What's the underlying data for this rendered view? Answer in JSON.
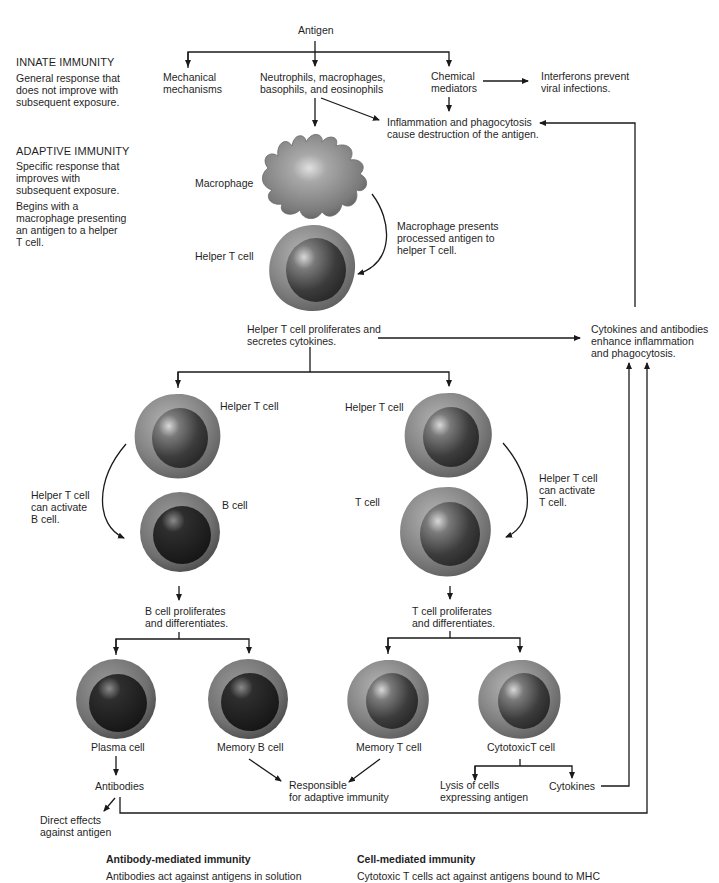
{
  "sidebar": {
    "innate": {
      "title": "INNATE IMMUNITY",
      "lines": [
        "General response that",
        "does not improve with",
        "subsequent exposure."
      ]
    },
    "adaptive": {
      "title": "ADAPTIVE IMMUNITY",
      "lines": [
        "Specific response that",
        "improves with",
        "subsequent exposure."
      ],
      "lines2": [
        "Begins with a",
        "macrophage presenting",
        "an antigen to a helper",
        "T cell."
      ]
    }
  },
  "nodes": {
    "antigen": "Antigen",
    "mechanical": [
      "Mechanical",
      "mechanisms"
    ],
    "neutrophils": [
      "Neutrophils, macrophages,",
      "basophils, and eosinophils"
    ],
    "chemical": [
      "Chemical",
      "mediators"
    ],
    "interferons": [
      "Interferons prevent",
      "viral infections."
    ],
    "inflammation": [
      "Inflammation and phagocytosis",
      "cause destruction of the antigen."
    ],
    "macrophage": "Macrophage",
    "macrophage_presents": [
      "Macrophage presents",
      "processed antigen to",
      "helper T cell."
    ],
    "helper_t_top": "Helper T cell",
    "helper_proliferates": [
      "Helper T cell proliferates and",
      "secretes cytokines."
    ],
    "cytokines_antibodies": [
      "Cytokines and antibodies",
      "enhance inflammation",
      "and phagocytosis."
    ],
    "helper_t_left": "Helper T cell",
    "helper_t_right": "Helper T cell",
    "activate_b": [
      "Helper T cell",
      "can activate",
      "B cell."
    ],
    "b_cell": "B cell",
    "t_cell": "T cell",
    "activate_t": [
      "Helper T cell",
      "can activate",
      "T cell."
    ],
    "b_proliferates": [
      "B cell proliferates",
      "and differentiates."
    ],
    "t_proliferates": [
      "T cell proliferates",
      "and differentiates."
    ],
    "plasma_cell": "Plasma cell",
    "memory_b": "Memory B cell",
    "memory_t": "Memory T cell",
    "cytotoxic_t": "CytotoxicT cell",
    "antibodies": "Antibodies",
    "responsible": [
      "Responsible",
      "for adaptive immunity"
    ],
    "lysis": [
      "Lysis of cells",
      "expressing antigen"
    ],
    "cytokines": "Cytokines",
    "direct_effects": [
      "Direct effects",
      "against antigen"
    ]
  },
  "footer": {
    "antibody_mediated": {
      "title": "Antibody-mediated immunity",
      "text": "Antibodies act against antigens in solution"
    },
    "cell_mediated": {
      "title": "Cell-mediated immunity",
      "text": "Cytotoxic T cells act against antigens bound to MHC"
    }
  },
  "colors": {
    "line": "#1a1a1a",
    "text": "#1f1f1f",
    "cell_body": "#8a8a8a",
    "nucleus_dark": "#2a2a2a"
  }
}
